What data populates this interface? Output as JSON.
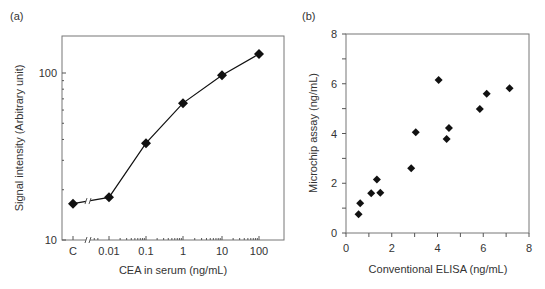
{
  "chart_data": [
    {
      "panel": "(a)",
      "type": "line",
      "title": "",
      "xlabel": "CEA in serum (ng/mL)",
      "ylabel": "Signal intensity (Arbitrary unit)",
      "x_scale": "log (with axis break after C)",
      "y_scale": "log",
      "ylim": [
        10,
        150
      ],
      "x_tick_labels": [
        "C",
        "0.01",
        "0.1",
        "1",
        "10",
        "100"
      ],
      "y_tick_labels": [
        "10",
        "100"
      ],
      "grid": false,
      "legend": null,
      "categories": [
        "C",
        "0.01",
        "0.1",
        "1",
        "10",
        "100"
      ],
      "values": [
        16.5,
        18,
        38,
        66,
        97,
        130
      ]
    },
    {
      "panel": "(b)",
      "type": "scatter",
      "title": "",
      "xlabel": "Conventional ELISA (ng/mL)",
      "ylabel": "Microchip assay (ng/mL)",
      "xlim": [
        0,
        8
      ],
      "ylim": [
        0,
        8
      ],
      "x_tick_labels": [
        "0",
        "2",
        "4",
        "6",
        "8"
      ],
      "y_tick_labels": [
        "0",
        "2",
        "4",
        "6",
        "8"
      ],
      "grid": false,
      "legend": null,
      "points": [
        {
          "x": 0.55,
          "y": 0.75
        },
        {
          "x": 0.62,
          "y": 1.2
        },
        {
          "x": 1.1,
          "y": 1.6
        },
        {
          "x": 1.35,
          "y": 2.15
        },
        {
          "x": 1.5,
          "y": 1.62
        },
        {
          "x": 2.85,
          "y": 2.6
        },
        {
          "x": 3.05,
          "y": 4.05
        },
        {
          "x": 4.05,
          "y": 6.15
        },
        {
          "x": 4.4,
          "y": 3.78
        },
        {
          "x": 4.5,
          "y": 4.22
        },
        {
          "x": 5.85,
          "y": 4.98
        },
        {
          "x": 6.15,
          "y": 5.6
        },
        {
          "x": 7.15,
          "y": 5.82
        }
      ]
    }
  ]
}
